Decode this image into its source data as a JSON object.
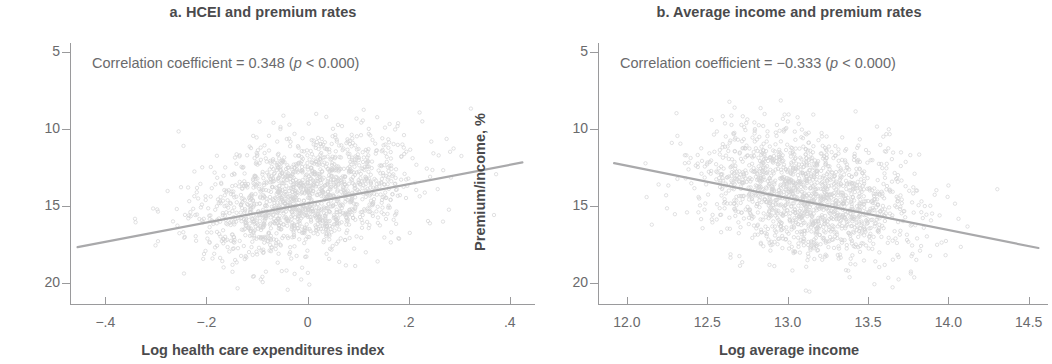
{
  "figure": {
    "panels": [
      {
        "key": "a",
        "title": "a. HCEI and premium rates",
        "annotation_prefix": "Correlation coefficient = 0.348 (",
        "annotation_italic": "p",
        "annotation_suffix": " < 0.000)",
        "xlabel": "Log health care expenditures index",
        "ylabel": "Premium/income, %",
        "xticks": [
          "−.4",
          "−.2",
          "0",
          ".2",
          ".4"
        ],
        "yticks": [
          "20",
          "15",
          "10",
          "5"
        ]
      },
      {
        "key": "b",
        "title": "b. Average income and premium rates",
        "annotation_prefix": "Correlation coefficient = −0.333 (",
        "annotation_italic": "p",
        "annotation_suffix": " < 0.000)",
        "xlabel": "Log average income",
        "ylabel": "Premium/income, %",
        "xticks": [
          "12.0",
          "12.5",
          "13.0",
          "13.5",
          "14.0",
          "14.5"
        ],
        "yticks": [
          "20",
          "15",
          "10",
          "5"
        ]
      }
    ],
    "colors": {
      "point": "#d4d4d6",
      "fit_line": "#a9a9ab",
      "axis": "#9a9a9c",
      "title_text": "#4a4a4c",
      "tick_text": "#6a6a6c",
      "background": "#ffffff"
    }
  },
  "chart_data": [
    {
      "type": "scatter",
      "panel": "a",
      "title": "a. HCEI and premium rates",
      "xlabel": "Log health care expenditures index",
      "ylabel": "Premium/income, %",
      "xlim": [
        -0.47,
        0.45
      ],
      "ylim": [
        3.6,
        20.6
      ],
      "xticks": [
        -0.4,
        -0.2,
        0,
        0.2,
        0.4
      ],
      "yticks": [
        5,
        10,
        15,
        20
      ],
      "grid": false,
      "legend": null,
      "n_points": 1600,
      "correlation": 0.348,
      "p_value_text": "p < 0.000",
      "annotation": "Correlation coefficient = 0.348 (p < 0.000)",
      "point_cloud": {
        "x_mean": -0.01,
        "x_sd": 0.105,
        "y_mean": 10.6,
        "y_sd": 2.05,
        "y_min": 4.4,
        "y_max": 16.6
      },
      "fit_line": {
        "x_start": -0.455,
        "y_start": 7.35,
        "x_end": 0.425,
        "y_end": 12.85,
        "slope": 6.25,
        "intercept": 10.19
      }
    },
    {
      "type": "scatter",
      "panel": "b",
      "title": "b. Average income and premium rates",
      "xlabel": "Log average income",
      "ylabel": "Premium/income, %",
      "xlim": [
        11.82,
        14.62
      ],
      "ylim": [
        3.6,
        20.6
      ],
      "xticks": [
        12.0,
        12.5,
        13.0,
        13.5,
        14.0,
        14.5
      ],
      "yticks": [
        5,
        10,
        15,
        20
      ],
      "grid": false,
      "legend": null,
      "n_points": 1600,
      "correlation": -0.333,
      "p_value_text": "p < 0.000",
      "annotation": "Correlation coefficient = −0.333 (p < 0.000)",
      "point_cloud": {
        "x_mean": 13.12,
        "x_sd": 0.33,
        "y_mean": 10.6,
        "y_sd": 2.05,
        "y_min": 4.4,
        "y_max": 17.4
      },
      "fit_line": {
        "x_start": 11.92,
        "y_start": 12.8,
        "x_end": 14.56,
        "y_end": 7.3,
        "slope": -2.08,
        "intercept": 37.62
      }
    }
  ]
}
